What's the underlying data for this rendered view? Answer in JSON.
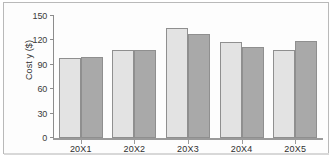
{
  "chart_data": {
    "type": "bar",
    "title": "",
    "xlabel": "",
    "ylabel": "Cost y ($)",
    "categories": [
      "20X1",
      "20X2",
      "20X3",
      "20X4",
      "20X5"
    ],
    "series": [
      {
        "name": "Series 1",
        "color": "#e3e3e3",
        "values": [
          98,
          108,
          135,
          118,
          108
        ]
      },
      {
        "name": "Series 2",
        "color": "#a9a9a9",
        "values": [
          99,
          108,
          128,
          112,
          119
        ]
      }
    ],
    "ylim": [
      0,
      150
    ],
    "yticks": [
      0,
      30,
      60,
      90,
      120,
      150
    ],
    "ytick_labels": [
      "0",
      "30",
      "60",
      "90",
      "120",
      "150"
    ],
    "grid": false,
    "legend": "none"
  }
}
